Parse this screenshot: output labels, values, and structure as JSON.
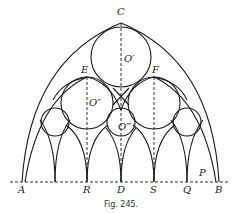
{
  "figure": {
    "caption": "Fig. 245.",
    "points": {
      "A": "A",
      "R": "R",
      "D": "D",
      "S": "S",
      "Q": "Q",
      "B": "B",
      "P": "P",
      "C": "C",
      "E": "E",
      "F": "F"
    },
    "centers": {
      "O1": "O′",
      "O2": "O″",
      "O3": "O‴"
    },
    "colors": {
      "line": "#1a1a1a",
      "background": "#ffffff"
    }
  }
}
